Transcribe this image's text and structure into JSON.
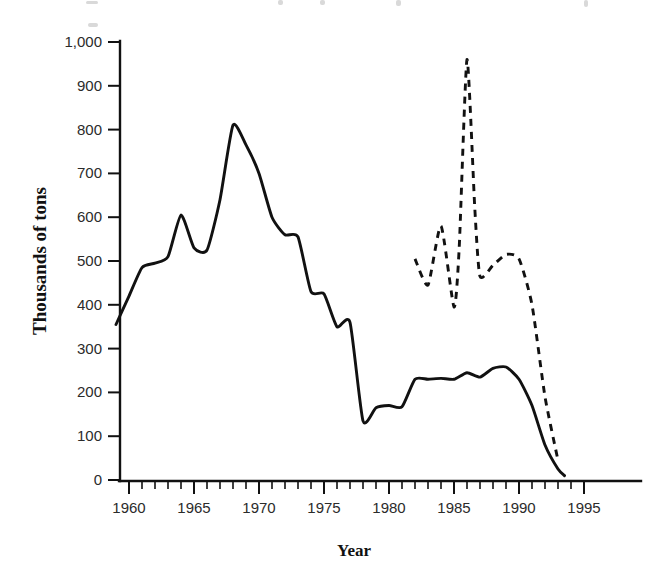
{
  "chart": {
    "title": "",
    "xlabel": "Year",
    "ylabel": "Thousands of tons"
  },
  "axes": {
    "y_ticks": [
      "0",
      "100",
      "200",
      "300",
      "400",
      "500",
      "600",
      "700",
      "800",
      "900",
      "1,000"
    ],
    "x_ticks": [
      "1960",
      "1965",
      "1970",
      "1975",
      "1980",
      "1985",
      "1990",
      "1995"
    ]
  },
  "chart_data": {
    "type": "line",
    "title": "",
    "xlabel": "Year",
    "ylabel": "Thousands of tons",
    "xlim": [
      1958,
      1998
    ],
    "ylim": [
      0,
      1000
    ],
    "grid": false,
    "legend": "none",
    "x_tick_values": [
      1960,
      1965,
      1970,
      1975,
      1980,
      1985,
      1990,
      1995
    ],
    "y_tick_values": [
      0,
      100,
      200,
      300,
      400,
      500,
      600,
      700,
      800,
      900,
      1000
    ],
    "x_minor_tick_interval": 1,
    "series": [
      {
        "name": "solid-series",
        "style": "solid",
        "color": "#111111",
        "x": [
          1959,
          1960,
          1961,
          1962,
          1963,
          1964,
          1965,
          1966,
          1967,
          1968,
          1969,
          1970,
          1971,
          1972,
          1973,
          1974,
          1975,
          1976,
          1977,
          1978,
          1979,
          1980,
          1981,
          1982,
          1983,
          1984,
          1985,
          1986,
          1987,
          1988,
          1989,
          1990,
          1991,
          1992,
          1993,
          1993.5
        ],
        "values": [
          355,
          420,
          485,
          495,
          510,
          605,
          530,
          525,
          640,
          810,
          765,
          700,
          600,
          560,
          555,
          430,
          425,
          350,
          360,
          135,
          165,
          170,
          167,
          230,
          230,
          232,
          230,
          245,
          235,
          255,
          258,
          230,
          170,
          80,
          25,
          10
        ]
      },
      {
        "name": "dashed-series",
        "style": "dashed",
        "color": "#111111",
        "x": [
          1982,
          1983,
          1984,
          1985,
          1985.4,
          1986,
          1986.6,
          1987,
          1988,
          1989,
          1990,
          1991,
          1992,
          1993
        ],
        "values": [
          505,
          445,
          580,
          395,
          530,
          960,
          620,
          465,
          490,
          515,
          505,
          400,
          190,
          45
        ]
      }
    ]
  }
}
